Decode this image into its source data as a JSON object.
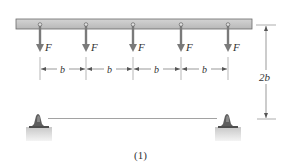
{
  "diagram": {
    "caption": "(1)",
    "force_label": "F",
    "spacing_label": "b",
    "height_label": "2b",
    "num_forces": 5,
    "colors": {
      "beam_fill": "#c8c8c8",
      "beam_stroke": "#6a6a6a",
      "arrow": "#7a7a7a",
      "dimension": "#555555",
      "support_dark": "#5a5a5a",
      "support_base": "#d6d6d6"
    },
    "forces": [
      {
        "label": "F"
      },
      {
        "label": "F"
      },
      {
        "label": "F"
      },
      {
        "label": "F"
      },
      {
        "label": "F"
      }
    ],
    "spacings": [
      {
        "label": "b"
      },
      {
        "label": "b"
      },
      {
        "label": "b"
      },
      {
        "label": "b"
      }
    ]
  }
}
